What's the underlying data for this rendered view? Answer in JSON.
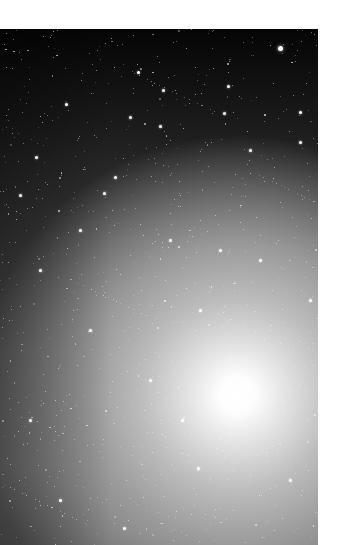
{
  "image": {
    "description": "Astronomical photograph of a star field with a bright diffuse galaxy core",
    "colors": {
      "background": "#ffffff",
      "sky_dark": "#050505",
      "core": "#ffffff"
    },
    "core_center": [
      237,
      366
    ],
    "stars": [
      [
        280,
        48,
        2.5
      ],
      [
        138,
        72
      ],
      [
        163,
        90
      ],
      [
        228,
        86
      ],
      [
        300,
        112
      ],
      [
        66,
        104
      ],
      [
        130,
        117
      ],
      [
        224,
        113
      ],
      [
        160,
        126
      ],
      [
        300,
        142
      ],
      [
        115,
        177
      ],
      [
        104,
        193
      ],
      [
        36,
        157
      ],
      [
        250,
        150
      ],
      [
        20,
        195
      ],
      [
        170,
        240
      ],
      [
        40,
        270
      ],
      [
        260,
        260
      ],
      [
        90,
        330
      ],
      [
        200,
        310
      ],
      [
        182,
        420
      ],
      [
        198,
        468
      ],
      [
        124,
        528
      ],
      [
        60,
        500
      ],
      [
        290,
        480
      ],
      [
        150,
        380
      ],
      [
        30,
        420
      ],
      [
        220,
        250
      ],
      [
        80,
        230
      ],
      [
        310,
        300
      ]
    ]
  }
}
